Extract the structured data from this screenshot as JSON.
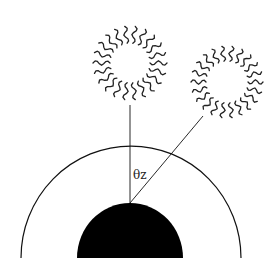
{
  "diagram": {
    "angle_label": "θz",
    "elements": {
      "sun_overhead": {
        "cx": 130,
        "cy": 63,
        "r": 20,
        "ray_len": 17,
        "rays": 22
      },
      "sun_oblique": {
        "cx": 227,
        "cy": 82,
        "r": 21,
        "ray_len": 15,
        "rays": 22
      },
      "earth": {
        "cx": 130,
        "cy": 258,
        "r": 53,
        "fill": "#000000"
      },
      "atmosphere": {
        "cx": 131,
        "cy": 258,
        "rx": 110,
        "ry": 112
      }
    },
    "colors": {
      "stroke": "#111111",
      "background": "#ffffff"
    }
  }
}
